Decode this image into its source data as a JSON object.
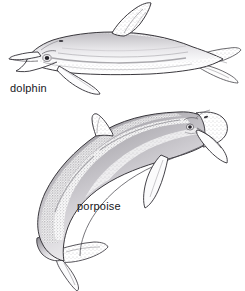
{
  "figure": {
    "type": "scientific-line-illustration",
    "medium": "pen-and-ink stipple drawing",
    "background_color": "#ffffff",
    "ink_color": "#2b2a2e",
    "stipple_color": "#6f6d73",
    "width": 245,
    "height": 291,
    "border": "none"
  },
  "labels": {
    "dolphin": "dolphin",
    "porpoise": "porpoise"
  },
  "specimens": [
    {
      "id": "dolphin",
      "label": "dolphin",
      "position": "top",
      "orientation": "horizontal profile, facing left",
      "head": "long pronounced beak (rostrum) with open mouth showing jaw line",
      "dorsal_fin": "tall curved falcate fin, mid-back",
      "flipper": "pectoral flipper angled down and back",
      "tail": "horizontal flukes at right edge",
      "shading": "light stipple along flank with darker lateral stripe"
    },
    {
      "id": "porpoise",
      "label": "porpoise",
      "position": "bottom",
      "orientation": "arched diving pose, head upper right, tail lower left",
      "head": "blunt rounded head, no beak",
      "dorsal_fin": "small low triangular fin",
      "flipper": "broad pectoral flipper pointing down",
      "tail": "flukes curving down to the lower left",
      "shading": "dense stipple across back, lighter belly"
    }
  ]
}
